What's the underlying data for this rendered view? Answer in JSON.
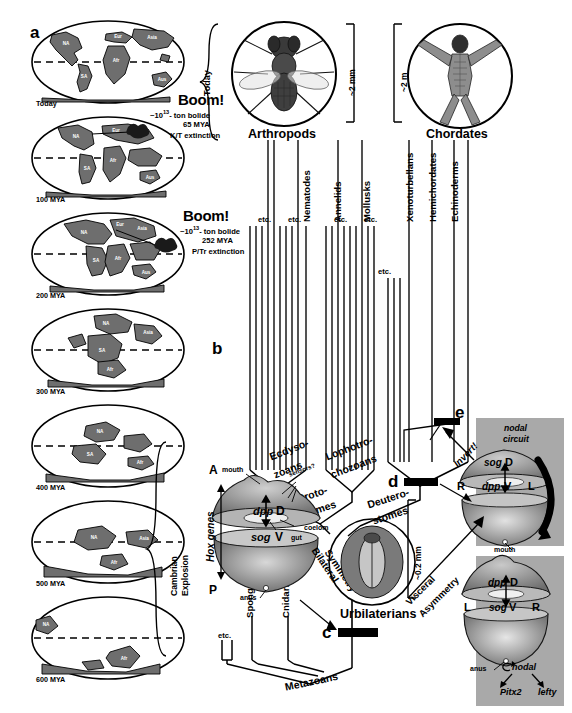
{
  "figure": {
    "panels": [
      "a",
      "b",
      "c",
      "d",
      "e"
    ],
    "panel_a_letter": "a",
    "panel_b_letter": "b",
    "panel_c_letter": "c",
    "panel_d_letter": "d",
    "panel_e_letter": "e"
  },
  "maps": {
    "items": [
      {
        "label": "Today",
        "continents": [
          "NA",
          "SA",
          "Eur",
          "Asia",
          "Afr",
          "Aus"
        ]
      },
      {
        "label": "100 MYA",
        "continents": [
          "NA",
          "SA",
          "Eur",
          "Asia",
          "Afr",
          "Aus"
        ]
      },
      {
        "label": "200 MYA",
        "continents": [
          "NA",
          "SA",
          "Eur",
          "Asia",
          "Afr",
          "Aus"
        ]
      },
      {
        "label": "300 MYA",
        "continents": [
          "NA",
          "SA",
          "Afr",
          "Asia"
        ]
      },
      {
        "label": "400 MYA",
        "continents": [
          "NA",
          "SA",
          "Afr"
        ]
      },
      {
        "label": "500 MYA",
        "continents": [
          "NA",
          "Asia",
          "Afr"
        ]
      },
      {
        "label": "600 MYA",
        "continents": [
          "NA",
          "Afr"
        ]
      }
    ]
  },
  "impacts": [
    {
      "title": "Boom!",
      "bolide_prefix": "~10",
      "bolide_exponent": "13",
      "bolide_suffix": "- ton bolide",
      "age": "65 MYA",
      "event": "K/T extinction"
    },
    {
      "title": "Boom!",
      "bolide_prefix": "~10",
      "bolide_exponent": "13",
      "bolide_suffix": "- ton bolide",
      "age": "252 MYA",
      "event": "P/Tr extinction"
    }
  ],
  "brackets": {
    "today": "Today",
    "cambrian_line1": "Cambrian",
    "cambrian_line2": "Explosion"
  },
  "organisms": [
    {
      "name": "Arthropods",
      "icon": "fly-icon",
      "scale": "~2 mm"
    },
    {
      "name": "Chordates",
      "icon": "vitruvian-man-icon",
      "scale": "~2 m"
    }
  ],
  "tree": {
    "taxa": [
      "Nematodes",
      "Annelids",
      "Mollusks",
      "Xenoturbellans",
      "Hemichordates",
      "Echinoderms"
    ],
    "etc_label": "etc.",
    "etc_count_protostome": 4,
    "etc_count_deuterostome": 1,
    "etc_count_basal": 1,
    "clades": {
      "ecdysozoans_l1": "Ecdyso-",
      "ecdysozoans_l2": "zoans",
      "lophotrochozoans_l1": "Lophotro-",
      "lophotrochozoans_l2": "chozoans",
      "protostomes_l1": "Proto-",
      "protostomes_l2": "stomes",
      "deuterostomes_l1": "Deutero-",
      "deuterostomes_l2": "stomes",
      "metazoans": "Metazoans",
      "urbilaterians": "Urbilaterians"
    },
    "basal_taxa": [
      "Sponges",
      "Cnidarians"
    ]
  },
  "urbilaterian": {
    "labels": {
      "mouth": "mouth",
      "sensors": "sensors?",
      "dpp": "dpp",
      "dorsal": "D",
      "sog": "sog",
      "ventral": "V",
      "gut": "gut",
      "coelom": "coelom",
      "anus": "anus",
      "anterior": "A",
      "posterior": "P",
      "hox": "Hox genes",
      "symmetry_l1": "Bilateral",
      "symmetry_l2": "Symmetry"
    },
    "scale": "~0.2 mm"
  },
  "chordate_inset": {
    "invert_label": "Invert!",
    "visceral_l1": "Visceral",
    "visceral_l2": "Asymmetry",
    "upper": {
      "circuit_l1": "nodal",
      "circuit_l2": "circuit",
      "sog": "sog",
      "dorsal": "D",
      "dpp": "dpp",
      "ventral": "V",
      "right": "R",
      "left": "L",
      "mouth": "mouth"
    },
    "lower": {
      "dpp": "dpp",
      "dorsal": "D",
      "sog": "sog",
      "ventral": "V",
      "left": "L",
      "right": "R",
      "anus": "anus",
      "nodal": "nodal",
      "pitx2": "Pitx2",
      "lefty": "lefty"
    }
  },
  "colors": {
    "ink": "#000000",
    "land": "#6e6e6e",
    "land_dark": "#4a4a4a",
    "shade_panel": "#a9a9a9",
    "body_light": "#c9c9c9",
    "body_mid": "#8d8d8d",
    "body_dark": "#3d3d3d"
  }
}
